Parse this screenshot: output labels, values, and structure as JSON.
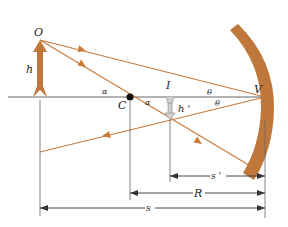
{
  "figure": {
    "type": "concave-mirror-ray-diagram",
    "colors": {
      "ray": "#c87a3a",
      "mirror": "#c0783a",
      "axis": "#555555",
      "object_arrow": "#c0783a",
      "image_arrow": "#c9c9c9",
      "text": "#222222"
    },
    "labels": {
      "object_point": "O",
      "object_height": "h",
      "center_of_curvature": "C",
      "image_point": "I",
      "image_height": "h '",
      "vertex": "V",
      "alpha_upper": "α",
      "alpha_lower": "α",
      "theta_upper": "θ",
      "theta_lower": "θ"
    },
    "dimensions": {
      "image_distance": "s '",
      "radius": "R",
      "object_distance": "s"
    }
  }
}
